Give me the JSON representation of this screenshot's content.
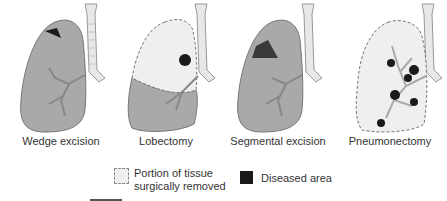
{
  "figure": {
    "panels": [
      {
        "label": "Wedge excision"
      },
      {
        "label": "Lobectomy"
      },
      {
        "label": "Segmental excision"
      },
      {
        "label": "Pneumonectomy"
      }
    ],
    "legend": {
      "removed_label_line1": "Portion of tissue",
      "removed_label_line2": "surgically removed",
      "diseased_label": "Diseased area"
    },
    "colors": {
      "lung": "#a9a9a9",
      "removed": "#efefef",
      "diseased": "#1a1a1a",
      "trachea": "#e8e8e8"
    }
  }
}
